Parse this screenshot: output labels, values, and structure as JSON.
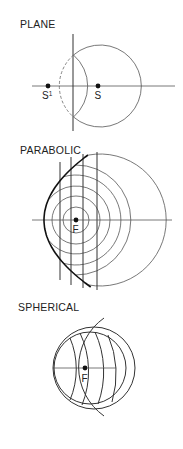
{
  "panels": [
    {
      "id": "plane",
      "title": "PLANE",
      "points": [
        {
          "label": "S",
          "superscript": "1",
          "description": "virtual image point"
        },
        {
          "label": "S",
          "superscript": "",
          "description": "source point"
        }
      ]
    },
    {
      "id": "parabolic",
      "title": "PARABOLIC",
      "points": [
        {
          "label": "F",
          "superscript": "",
          "description": "focus"
        }
      ]
    },
    {
      "id": "spherical",
      "title": "SPHERICAL",
      "points": [
        {
          "label": "F",
          "superscript": "",
          "description": "focus"
        }
      ]
    }
  ],
  "colors": {
    "ink": "#111111",
    "background": "#ffffff"
  }
}
